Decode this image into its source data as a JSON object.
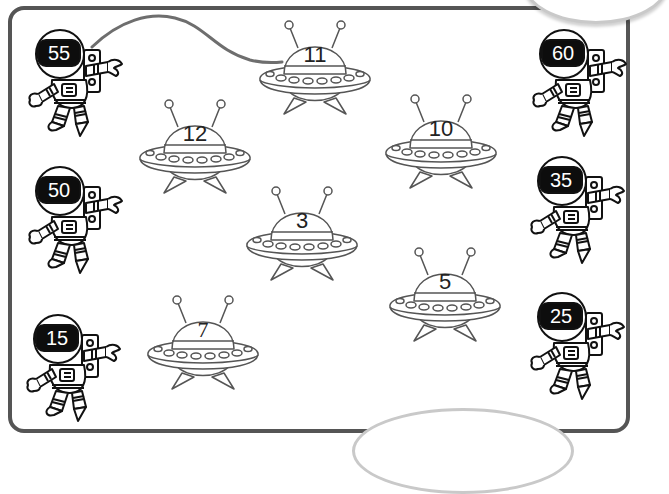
{
  "worksheet": {
    "theme": "astronauts-and-ufos-matching",
    "example_connection": {
      "from": "55",
      "to": "11",
      "line_color": "#6e6e6e"
    },
    "frame_color": "#555555"
  },
  "astronauts": {
    "left": [
      {
        "label": "55",
        "x": 24,
        "y": 28
      },
      {
        "label": "50",
        "x": 24,
        "y": 165
      },
      {
        "label": "15",
        "x": 22,
        "y": 313
      }
    ],
    "right": [
      {
        "label": "60",
        "x": 528,
        "y": 28
      },
      {
        "label": "35",
        "x": 526,
        "y": 155
      },
      {
        "label": "25",
        "x": 526,
        "y": 291
      }
    ]
  },
  "ufos": [
    {
      "label": "11",
      "x": 258,
      "y": 18
    },
    {
      "label": "12",
      "x": 138,
      "y": 97
    },
    {
      "label": "10",
      "x": 384,
      "y": 92
    },
    {
      "label": "3",
      "x": 245,
      "y": 184
    },
    {
      "label": "5",
      "x": 388,
      "y": 245
    },
    {
      "label": "7",
      "x": 146,
      "y": 293
    }
  ]
}
